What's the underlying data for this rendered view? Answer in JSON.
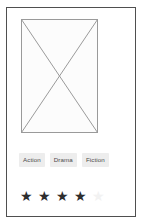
{
  "card": {
    "background_color": "#ffffff",
    "border_color": "#4f4f4f"
  },
  "media": {
    "placeholder_icon": "image-placeholder-x-icon",
    "fill_color": "#fcfcfc",
    "line_color": "#9a9a9a"
  },
  "genres": {
    "chip_background_color": "#ededed",
    "chip_text_color": "#4a4a4a",
    "items": [
      {
        "label": "Action"
      },
      {
        "label": "Drama"
      },
      {
        "label": "Fiction"
      }
    ]
  },
  "rating": {
    "glyph": "★",
    "filled_count": 4,
    "total_count": 5,
    "filled_color": "#2e2e2e",
    "empty_color": "#f2f2f2",
    "stars": [
      {
        "glyph": "★",
        "state": "filled"
      },
      {
        "glyph": "★",
        "state": "filled"
      },
      {
        "glyph": "★",
        "state": "filled"
      },
      {
        "glyph": "★",
        "state": "filled"
      },
      {
        "glyph": "★",
        "state": "empty"
      }
    ]
  }
}
